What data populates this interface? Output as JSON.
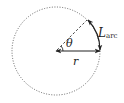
{
  "diagram": {
    "colors": {
      "stroke": "#222222",
      "circle": "#555555",
      "background": "#ffffff"
    },
    "circle": {
      "cx": 56,
      "cy": 51,
      "r": 44,
      "style": "dotted"
    },
    "angle_deg": 45,
    "labels": {
      "radius": "r",
      "angle": "θ",
      "arc_main": "L",
      "arc_sub": "arc"
    }
  }
}
